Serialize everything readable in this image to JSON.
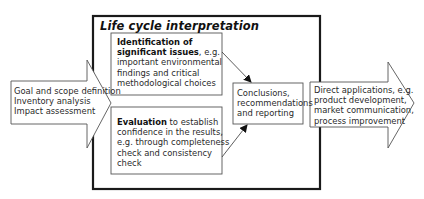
{
  "diagram": {
    "frame": {
      "title": "Life cycle interpretation"
    },
    "input_arrow": {
      "lines": [
        "Goal and scope definition",
        "Inventory analysis",
        "Impact assessment"
      ]
    },
    "identification_box": {
      "bold": "Identification of significant issues",
      "bold_line1": "Identification of",
      "bold_line2": "significant issues",
      "rest_line2": ", e.g.",
      "lines": [
        "important environmental",
        "findings and critical",
        "methodological choices"
      ]
    },
    "evaluation_box": {
      "bold": "Evaluation",
      "rest_line1": " to establish",
      "lines": [
        "confidence in the results,",
        "e.g. through completeness",
        "check and consistency",
        "check"
      ]
    },
    "conclusions_box": {
      "lines": [
        "Conclusions,",
        "recommendations",
        "and reporting"
      ]
    },
    "output_arrow": {
      "lines": [
        "Direct applications, e.g.",
        "product development,",
        "market communication,",
        "process improvement"
      ]
    }
  },
  "colors": {
    "frame": "#1a1a1a",
    "box_stroke": "#555555",
    "text": "#2a2a2a"
  }
}
